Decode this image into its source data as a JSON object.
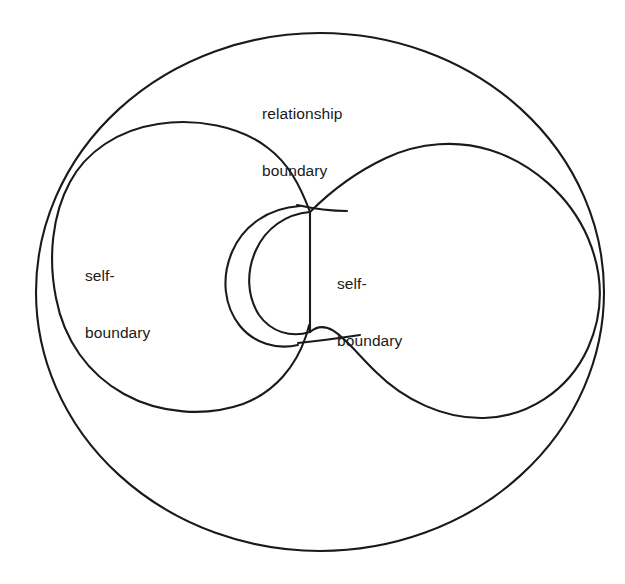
{
  "diagram": {
    "type": "line-diagram",
    "background_color": "#ffffff",
    "stroke_color": "#1a1a1a",
    "text_color": "#1a1a1a",
    "outer_shape": {
      "name": "relationship-boundary-circle",
      "label": "relationship\nboundary"
    },
    "left_shape": {
      "name": "left-self-boundary-teardrop",
      "label": "self-\nboundary"
    },
    "right_shape": {
      "name": "right-self-boundary-teardrop",
      "label": "self-\nboundary"
    },
    "labels": {
      "relationship_line1": "relationship",
      "relationship_line2": "boundary",
      "self_left_line1": "self-",
      "self_left_line2": "boundary",
      "self_right_line1": "self-",
      "self_right_line2": "boundary"
    }
  }
}
